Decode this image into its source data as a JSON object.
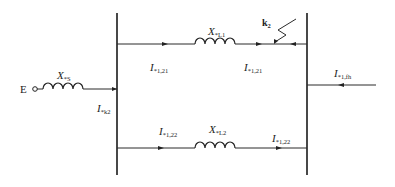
{
  "diagram": {
    "type": "circuit-schematic",
    "title": "",
    "source": {
      "label": "E",
      "reactance": {
        "symbol": "X",
        "subscript": "*S"
      }
    },
    "branches": [
      {
        "id": "top",
        "reactance": {
          "symbol": "X",
          "subscript": "*L1"
        },
        "current_left": {
          "symbol": "I",
          "subscript": "*1,21"
        },
        "current_right": {
          "symbol": "I",
          "subscript": "*1,21"
        },
        "fault": {
          "label": "k",
          "subscript": "2"
        }
      },
      {
        "id": "bottom",
        "reactance": {
          "symbol": "X",
          "subscript": "*L2"
        },
        "current_left": {
          "symbol": "I",
          "subscript": "*1,22"
        },
        "current_right": {
          "symbol": "I",
          "subscript": "*1,22"
        }
      }
    ],
    "source_current": {
      "symbol": "I",
      "subscript": "*k2"
    },
    "feeder_current": {
      "symbol": "I",
      "subscript": "*1,fh"
    }
  }
}
